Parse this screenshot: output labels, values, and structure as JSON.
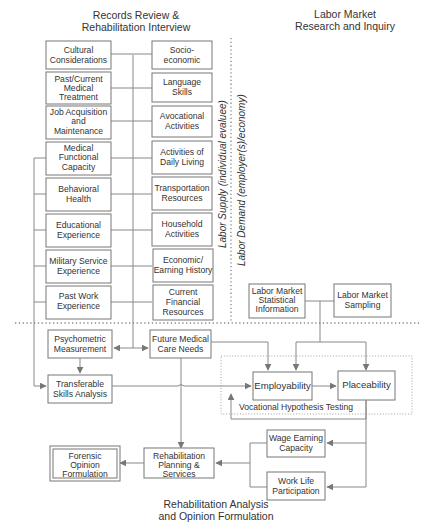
{
  "headings": {
    "records_review": [
      "Records Review &",
      "Rehabilitation Interview"
    ],
    "labor_market": [
      "Labor Market",
      "Research and Inquiry"
    ],
    "rehab_analysis": [
      "Rehabilitation Analysis",
      "and Opinion Formulation"
    ]
  },
  "divider_labels": {
    "labor_supply": "Labor Supply (individual evaluee)",
    "labor_demand": "Labor Demand (employer(s)/economy)"
  },
  "left_column": [
    [
      "Cultural",
      "Considerations"
    ],
    [
      "Past/Current",
      "Medical",
      "Treatment"
    ],
    [
      "Job Acquisition",
      "and",
      "Maintenance"
    ],
    [
      "Medical",
      "Functional",
      "Capacity"
    ],
    [
      "Behavioral",
      "Health"
    ],
    [
      "Educational",
      "Experience"
    ],
    [
      "Military Service",
      "Experience"
    ],
    [
      "Past Work",
      "Experience"
    ]
  ],
  "right_column": [
    [
      "Socio-",
      "economic"
    ],
    [
      "Language",
      "Skills"
    ],
    [
      "Avocational",
      "Activities"
    ],
    [
      "Activities of",
      "Daily Living"
    ],
    [
      "Transportation",
      "Resources"
    ],
    [
      "Household",
      "Activities"
    ],
    [
      "Economic/",
      "Earning History"
    ],
    [
      "Current",
      "Financial",
      "Resources"
    ]
  ],
  "labor_market_boxes": {
    "statistical": [
      "Labor Market",
      "Statistical",
      "Information"
    ],
    "sampling": [
      "Labor Market",
      "Sampling"
    ]
  },
  "analysis_boxes": {
    "psychometric": [
      "Psychometric",
      "Measurement"
    ],
    "future_medical": [
      "Future Medical",
      "Care Needs"
    ],
    "transferable": [
      "Transferable",
      "Skills Analysis"
    ],
    "employability": [
      "Employability"
    ],
    "placeability": [
      "Placeability"
    ],
    "vocational_testing": "Vocational Hypothesis Testing",
    "wage_earning": [
      "Wage Earning",
      "Capacity"
    ],
    "work_life": [
      "Work Life",
      "Participation"
    ],
    "rehab_planning": [
      "Rehabilitation",
      "Planning &",
      "Services"
    ],
    "forensic": [
      "Forensic",
      "Opinion",
      "Formulation"
    ]
  },
  "colors": {
    "line": "#888888",
    "box_border": "#777777",
    "text": "#333333"
  }
}
